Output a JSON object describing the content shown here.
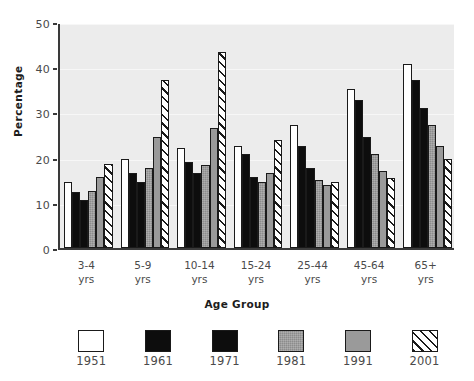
{
  "chart_data": {
    "type": "bar",
    "title": "",
    "subtitle": "",
    "xlabel": "Age Group",
    "ylabel": "Percentage",
    "ylim": [
      0,
      50
    ],
    "yticks": [
      0,
      10,
      20,
      30,
      40,
      50
    ],
    "grid": true,
    "legend_position": "bottom",
    "categories": [
      "3-4\nyrs",
      "5-9\nyrs",
      "10-14\nyrs",
      "15-24\nyrs",
      "25-44\nyrs",
      "45-64\nyrs",
      "65+\nyrs"
    ],
    "category_lines": [
      [
        "3-4",
        "yrs"
      ],
      [
        "5-9",
        "yrs"
      ],
      [
        "10-14",
        "yrs"
      ],
      [
        "15-24",
        "yrs"
      ],
      [
        "25-44",
        "yrs"
      ],
      [
        "45-64",
        "yrs"
      ],
      [
        "65+",
        "yrs"
      ]
    ],
    "series": [
      {
        "name": "1951",
        "fill": "white",
        "color": "#ffffff",
        "values": [
          14.5,
          19.6,
          22.1,
          22.6,
          27.2,
          35.2,
          40.8
        ]
      },
      {
        "name": "1961",
        "fill": "black",
        "color": "#0d0d0d",
        "values": [
          12.5,
          16.5,
          19.1,
          20.8,
          22.6,
          32.7,
          37.2
        ]
      },
      {
        "name": "1971",
        "fill": "black",
        "color": "#0d0d0d",
        "values": [
          10.7,
          14.6,
          16.6,
          15.7,
          17.7,
          24.5,
          31.0
        ]
      },
      {
        "name": "1981",
        "fill": "gray-tex",
        "color": "#8c8c8c",
        "values": [
          12.6,
          17.7,
          18.3,
          14.6,
          15.1,
          20.7,
          27.2
        ]
      },
      {
        "name": "1991",
        "fill": "gray",
        "color": "#9a9a9a",
        "values": [
          15.7,
          24.5,
          26.5,
          16.5,
          14.0,
          17.1,
          22.6
        ]
      },
      {
        "name": "2001",
        "fill": "hatch",
        "color": "#ffffff",
        "values": [
          18.6,
          37.2,
          43.4,
          24.0,
          14.5,
          15.5,
          19.6
        ]
      }
    ]
  },
  "axis": {
    "y_tick_labels": [
      "0",
      "10",
      "20",
      "30",
      "40",
      "50"
    ],
    "y_title": "Percentage",
    "x_title": "Age Group"
  },
  "legend": {
    "items": [
      {
        "label": "1951",
        "swatch": "white-swatch"
      },
      {
        "label": "1961",
        "swatch": "black-swatch"
      },
      {
        "label": "1971",
        "swatch": "black-swatch"
      },
      {
        "label": "1981",
        "swatch": "gray-textured-swatch"
      },
      {
        "label": "1991",
        "swatch": "gray-swatch"
      },
      {
        "label": "2001",
        "swatch": "hatched-swatch"
      }
    ]
  },
  "colors": {
    "plot_background": "#ececec",
    "page_background": "#ffffff",
    "axis": "#3a3a3a",
    "bar_outline": "#1a1a1a",
    "tick_text": "#4a4a4a",
    "title_text": "#1c1c1c"
  }
}
